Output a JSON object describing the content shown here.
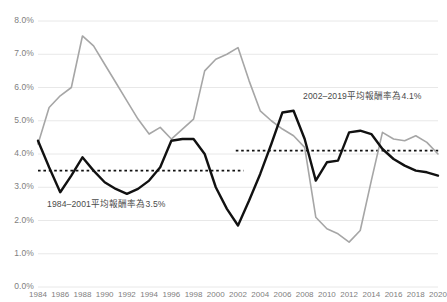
{
  "chart_data": {
    "type": "line",
    "title": "",
    "xlabel": "",
    "ylabel": "",
    "xlim": [
      1984,
      2020
    ],
    "ylim": [
      0.0,
      8.0
    ],
    "ytick_step": 1.0,
    "grid": "horizontal",
    "legend": "none",
    "y_tick_labels": [
      "8.0%",
      "7.0%",
      "6.0%",
      "5.0%",
      "4.0%",
      "3.0%",
      "2.0%",
      "1.0%",
      "0.0%"
    ],
    "y_tick_values": [
      8.0,
      7.0,
      6.0,
      5.0,
      4.0,
      3.0,
      2.0,
      1.0,
      0.0
    ],
    "x_tick_labels": [
      "1984",
      "1986",
      "1988",
      "1990",
      "1992",
      "1994",
      "1996",
      "1998",
      "2000",
      "2002",
      "2004",
      "2006",
      "2008",
      "2010",
      "2012",
      "2014",
      "2016",
      "2018",
      "2020"
    ],
    "x_tick_values": [
      1984,
      1986,
      1988,
      1990,
      1992,
      1994,
      1996,
      1998,
      2000,
      2002,
      2004,
      2006,
      2008,
      2010,
      2012,
      2014,
      2016,
      2018,
      2020
    ],
    "x": [
      1984,
      1985,
      1986,
      1987,
      1988,
      1989,
      1990,
      1991,
      1992,
      1993,
      1994,
      1995,
      1996,
      1997,
      1998,
      1999,
      2000,
      2001,
      2002,
      2003,
      2004,
      2005,
      2006,
      2007,
      2008,
      2009,
      2010,
      2011,
      2012,
      2013,
      2014,
      2015,
      2016,
      2017,
      2018,
      2019,
      2020
    ],
    "series": [
      {
        "name": "grey-series",
        "color": "#a6a6a6",
        "width": 1.6,
        "values": [
          4.3,
          5.4,
          5.75,
          6.0,
          7.55,
          7.25,
          6.7,
          6.15,
          5.6,
          5.05,
          4.6,
          4.8,
          4.45,
          4.75,
          5.05,
          6.5,
          6.85,
          7.0,
          7.2,
          6.2,
          5.3,
          5.0,
          4.75,
          4.55,
          4.2,
          2.1,
          1.75,
          1.6,
          1.35,
          1.7,
          3.2,
          4.65,
          4.45,
          4.4,
          4.55,
          4.35,
          4.0
        ]
      },
      {
        "name": "black-series",
        "color": "#111111",
        "width": 2.4,
        "values": [
          4.4,
          3.6,
          2.85,
          3.35,
          3.9,
          3.5,
          3.15,
          2.95,
          2.8,
          2.95,
          3.2,
          3.6,
          4.4,
          4.45,
          4.45,
          4.0,
          3.0,
          2.35,
          1.85,
          2.6,
          3.4,
          4.3,
          5.25,
          5.3,
          4.45,
          3.2,
          3.75,
          3.8,
          4.65,
          4.7,
          4.6,
          4.15,
          3.85,
          3.65,
          3.5,
          3.45,
          3.35
        ]
      }
    ],
    "reference_lines": [
      {
        "name": "avg-1984-2001",
        "value": 3.5,
        "x_start": 1984,
        "x_end": 2002.5,
        "style": "dotted",
        "color": "#111111",
        "label": "1984–2001平均報酬率為3.5%"
      },
      {
        "name": "avg-2002-2019",
        "value": 4.1,
        "x_start": 2001.8,
        "x_end": 2020.5,
        "style": "dotted",
        "color": "#111111",
        "label": "2002–2019平均報酬率為4.1%"
      }
    ],
    "annotations": [
      {
        "name": "annotation-left",
        "text": "1984–2001平均報酬率為3.5%",
        "x_px": 47,
        "y_px": 197
      },
      {
        "name": "annotation-right",
        "text": "2002–2019平均報酬率為4.1%",
        "x_px": 303,
        "y_px": 89
      }
    ],
    "colors": {
      "grid": "#e8e8e8",
      "grey_line": "#a6a6a6",
      "black_line": "#111111",
      "tick_text": "#808080",
      "annotation_text": "#4a4a4a",
      "background": "#ffffff"
    }
  },
  "plot_geometry": {
    "left": 38,
    "right": 438,
    "top": 21,
    "bottom": 287
  }
}
